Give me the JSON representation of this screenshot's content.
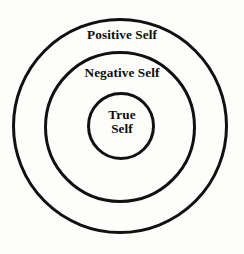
{
  "diagram": {
    "type": "concentric-circles",
    "background_color": "#fdfdfc",
    "stroke_color": "#111111",
    "text_color": "#0c0c0c",
    "rings": [
      {
        "id": "outer",
        "label": "Positive Self",
        "center_x": 120,
        "center_y": 126,
        "diameter": 215,
        "stroke_width": 3
      },
      {
        "id": "middle",
        "label": "Negative Self",
        "center_x": 120,
        "center_y": 127,
        "diameter": 149,
        "stroke_width": 3
      },
      {
        "id": "inner",
        "label_line_1": "True",
        "label_line_2": "Self",
        "center_x": 121,
        "center_y": 126,
        "diameter": 65,
        "stroke_width": 3
      }
    ]
  }
}
